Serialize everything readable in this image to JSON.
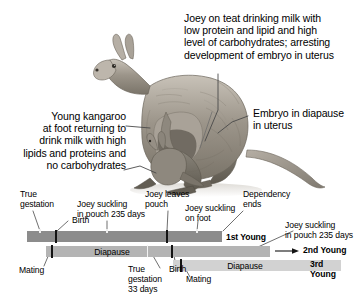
{
  "figure": {
    "title_alt": "Kangaroo reproductive cycle diagram with embryonic diapause timeline",
    "illustration": "kangaroo-with-joey-illustration"
  },
  "callouts": {
    "joey_on_teat": "Joey on teat drinking milk with\nlow protein and lipid and high\nlevel of carbohydrates; arresting\ndevelopment of embryo in uterus",
    "embryo_diapause": "Embryo in diapause\nin uterus",
    "young_at_foot": "Young kangaroo\nat foot returning to\ndrink milk with high\nlipids and proteins and\nno carbohydrates"
  },
  "timeline": {
    "labels": {
      "true_gestation": "True\ngestation",
      "birth": "Birth",
      "joey_suckling_pouch": "Joey suckling\nin pouch 235 days",
      "joey_leaves_pouch": "Joey leaves\npouch",
      "joey_suckling_foot": "Joey suckling\non foot",
      "dependency_ends": "Dependency\nends",
      "joey_suckling_pouch_2": "Joey suckling\nin pouch 235 days",
      "mating_1": "Mating",
      "diapause_1": "Diapause",
      "true_gestation_33": "True\ngestation\n33 days",
      "birth_2": "Birth",
      "mating_2": "Mating",
      "diapause_2": "Diapause",
      "first_young": "1st Young",
      "second_young": "2nd Young",
      "third_young": "3rd\nYoung"
    },
    "colors": {
      "bar_1": "#8c8c8c",
      "bar_2": "#b4b4b4",
      "bar_3": "#d2d2d2",
      "tick": "#141414",
      "leader": "#555555",
      "text": "#000000"
    },
    "bars": [
      {
        "name": "1st Young",
        "left": 27,
        "width": 195,
        "color": "#8c8c8c"
      },
      {
        "name": "2nd Young",
        "left": 46,
        "width": 224,
        "color": "#b4b4b4"
      },
      {
        "name": "3rd Young",
        "left": 173,
        "width": 168,
        "color": "#d2d2d2"
      }
    ]
  }
}
